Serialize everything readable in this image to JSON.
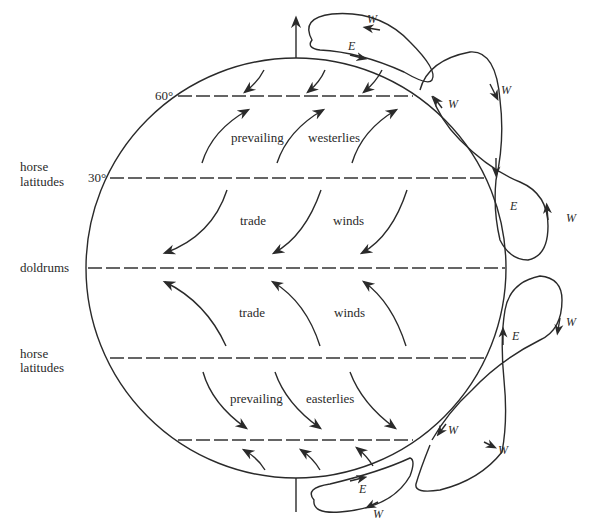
{
  "diagram": {
    "type": "global-atmospheric-circulation",
    "left_labels": {
      "horse_latitudes_north_line1": "horse",
      "horse_latitudes_north_line2": "latitudes",
      "doldrums": "doldrums",
      "horse_latitudes_south_line1": "horse",
      "horse_latitudes_south_line2": "latitudes"
    },
    "latitude_labels": {
      "sixty": "60°",
      "thirty": "30°"
    },
    "belt_labels": {
      "north_westerlies_word1": "prevailing",
      "north_westerlies_word2": "westerlies",
      "north_trade_word1": "trade",
      "north_trade_word2": "winds",
      "south_trade_word1": "trade",
      "south_trade_word2": "winds",
      "south_easterlies_word1": "prevailing",
      "south_easterlies_word2": "easterlies"
    },
    "jet_labels": {
      "top_loop_w": "W",
      "top_loop_e": "E",
      "upper_right_w1": "W",
      "upper_right_w2": "W",
      "upper_right_e": "E",
      "upper_right_w3": "W",
      "lower_right_w1": "W",
      "lower_right_e": "E",
      "lower_right_w2": "W",
      "lower_right_w3": "W",
      "bottom_loop_e": "E",
      "bottom_loop_w": "W"
    },
    "colors": {
      "ink": "#2a2a2a",
      "background": "#ffffff"
    }
  }
}
